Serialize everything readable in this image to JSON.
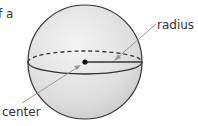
{
  "fragment_text": "f a",
  "labels": {
    "radius": "radius",
    "center": "center"
  },
  "colors": {
    "sphere_fill_light": "#f2f2f2",
    "sphere_fill_dark": "#c9c9c9",
    "outline": "#333333",
    "pointer": "#9a9a9a"
  }
}
